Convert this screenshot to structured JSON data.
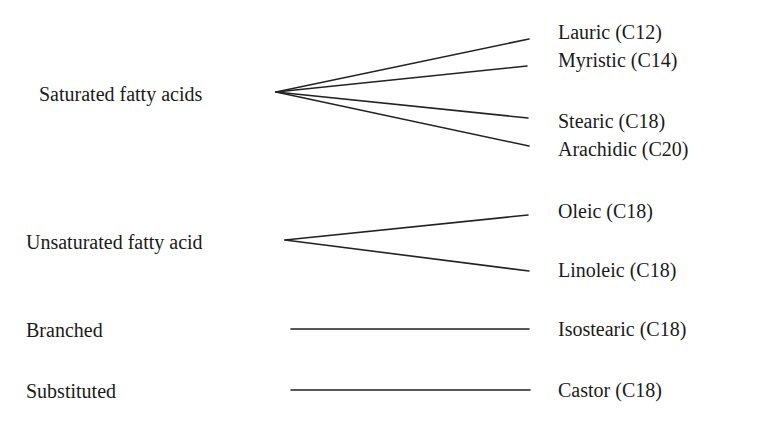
{
  "diagram": {
    "categories": [
      {
        "label": "Saturated fatty acids",
        "acids": [
          "Lauric (C12)",
          "Myristic (C14)",
          "Stearic (C18)",
          "Arachidic (C20)"
        ]
      },
      {
        "label": "Unsaturated fatty acid",
        "acids": [
          "Oleic (C18)",
          "Linoleic (C18)"
        ]
      },
      {
        "label": "Branched",
        "acids": [
          "Isostearic (C18)"
        ]
      },
      {
        "label": "Substituted",
        "acids": [
          "Castor (C18)"
        ]
      }
    ]
  }
}
